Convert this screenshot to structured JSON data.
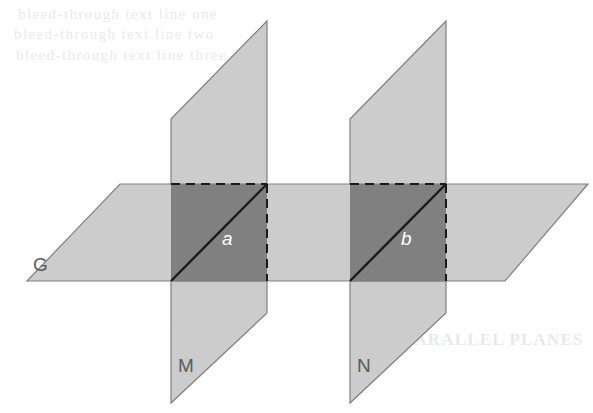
{
  "figure": {
    "labels": {
      "plane_g": "G",
      "plane_m": "M",
      "plane_n": "N",
      "line_a": "a",
      "line_b": "b"
    },
    "colors": {
      "background": "#ffffff",
      "plane_light_fill": "#cccccc",
      "plane_light_stroke": "#808080",
      "intersection_fill": "#808080",
      "intersection_stroke": "#1a1a1a",
      "label_dark": "#5a5a5a",
      "label_light": "#ffffff",
      "ghost_text": "#e9e9ec"
    },
    "ghost_text": {
      "line1": "bleed-through text line one",
      "line2": "bleed-through text line two",
      "line3": "bleed-through text line three",
      "line4": "PARALLEL PLANES"
    }
  },
  "geometry": {
    "plane_g": {
      "name": "horizontal-plane-G",
      "points": "120,184 588,184 505,281 27,281"
    },
    "plane_m_upper": {
      "name": "vertical-plane-M-upper",
      "points": "171,119 267,21 267,184 171,184"
    },
    "plane_m_lower": {
      "name": "vertical-plane-M-lower",
      "points": "171,281 267,281 267,313 171,403"
    },
    "plane_n_upper": {
      "name": "vertical-plane-N-upper",
      "points": "350,119 446,21 446,184 350,184"
    },
    "plane_n_lower": {
      "name": "vertical-plane-N-lower",
      "points": "350,281 446,281 446,313 350,403"
    },
    "intersection_a": {
      "name": "intersection-region-a",
      "points": "171,184 267,184 267,281 171,281"
    },
    "intersection_b": {
      "name": "intersection-region-b",
      "points": "350,184 446,184 446,281 350,281"
    },
    "line_a_segment": {
      "x1": 171,
      "y1": 281,
      "x2": 267,
      "y2": 184
    },
    "line_b_segment": {
      "x1": 350,
      "y1": 281,
      "x2": 446,
      "y2": 184
    },
    "label_positions": {
      "plane_g": {
        "x": 33,
        "y": 271
      },
      "plane_m": {
        "x": 178,
        "y": 372
      },
      "plane_n": {
        "x": 357,
        "y": 372
      },
      "line_a": {
        "x": 222,
        "y": 245
      },
      "line_b": {
        "x": 401,
        "y": 245
      }
    }
  }
}
